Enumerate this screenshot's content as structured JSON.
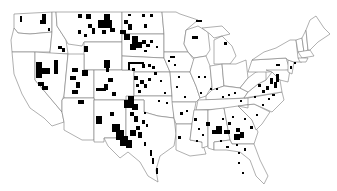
{
  "map": {
    "type": "choropleth",
    "region": "Contiguous United States",
    "level": "county",
    "colors": {
      "background": "#ffffff",
      "state_border": "#7a7a7a",
      "highlighted_county": "#000000",
      "unhighlighted": "#ffffff"
    },
    "legend": null,
    "title": null,
    "highlight_clusters": [
      {
        "area": "Montana / North Dakota / South Dakota",
        "density": "high"
      },
      {
        "area": "Nebraska / Kansas",
        "density": "high"
      },
      {
        "area": "West Texas / New Mexico border",
        "density": "high"
      },
      {
        "area": "Nevada / Utah",
        "density": "medium"
      },
      {
        "area": "Wyoming / Colorado",
        "density": "medium"
      },
      {
        "area": "Georgia / Alabama",
        "density": "medium"
      },
      {
        "area": "Virginia / Maryland",
        "density": "medium"
      },
      {
        "area": "Wisconsin / Michigan",
        "density": "low"
      },
      {
        "area": "Florida",
        "density": "low"
      }
    ]
  }
}
